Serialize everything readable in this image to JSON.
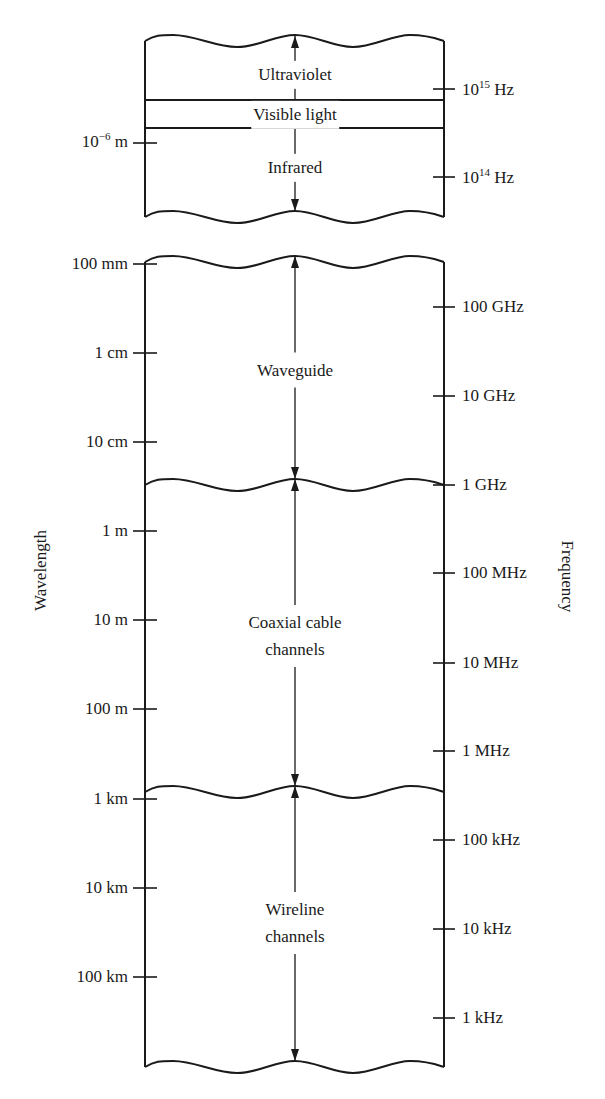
{
  "diagram": {
    "axis_titles": {
      "left": "Wavelength",
      "right": "Frequency"
    },
    "colors": {
      "ink": "#1a1a1a",
      "background": "#ffffff"
    },
    "top_box": {
      "bands": [
        {
          "name": "ultraviolet",
          "label": "Ultraviolet",
          "y": 75
        },
        {
          "name": "visible-light",
          "label": "Visible light",
          "y": 115
        },
        {
          "name": "infrared",
          "label": "Infrared",
          "y": 168
        }
      ],
      "visible_light_lines_y": [
        100,
        128
      ],
      "wavelength_ticks": [
        {
          "base": "10",
          "exp": "−6",
          "unit": " m",
          "y": 143
        }
      ],
      "frequency_ticks": [
        {
          "base": "10",
          "exp": "15",
          "unit": " Hz",
          "y": 89
        },
        {
          "base": "10",
          "exp": "14",
          "unit": " Hz",
          "y": 177
        }
      ]
    },
    "main_box": {
      "bands": [
        {
          "name": "waveguide",
          "lines": [
            "Waveguide"
          ],
          "y": 370,
          "arrow_from": 262,
          "arrow_to": 485
        },
        {
          "name": "coaxial-cable-channels",
          "lines": [
            "Coaxial cable",
            "channels"
          ],
          "y": 636,
          "arrow_from": 485,
          "arrow_to": 792
        },
        {
          "name": "wireline-channels",
          "lines": [
            "Wireline",
            "channels"
          ],
          "y": 923,
          "arrow_from": 792,
          "arrow_to": 1067
        }
      ],
      "wavelength_ticks": [
        {
          "label": "100 mm",
          "y": 264
        },
        {
          "label": "1 cm",
          "y": 353
        },
        {
          "label": "10 cm",
          "y": 442
        },
        {
          "label": "1 m",
          "y": 531
        },
        {
          "label": "10 m",
          "y": 620
        },
        {
          "label": "100 m",
          "y": 709
        },
        {
          "label": "1 km",
          "y": 799
        },
        {
          "label": "10 km",
          "y": 888
        },
        {
          "label": "100 km",
          "y": 977
        }
      ],
      "frequency_ticks": [
        {
          "label": "100 GHz",
          "y": 307
        },
        {
          "label": "10 GHz",
          "y": 396
        },
        {
          "label": "1 GHz",
          "y": 485
        },
        {
          "label": "100 MHz",
          "y": 573
        },
        {
          "label": "10 MHz",
          "y": 663
        },
        {
          "label": "1 MHz",
          "y": 751
        },
        {
          "label": "100 kHz",
          "y": 840
        },
        {
          "label": "10 kHz",
          "y": 929
        },
        {
          "label": "1 kHz",
          "y": 1018
        }
      ]
    }
  }
}
